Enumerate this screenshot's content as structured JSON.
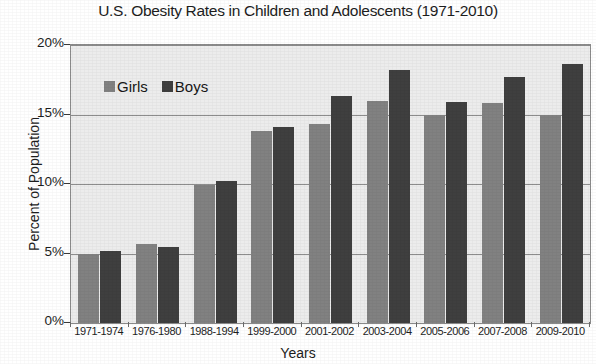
{
  "chart_data": {
    "type": "bar",
    "title": "U.S. Obesity Rates in Children and Adolescents (1971-2010)",
    "xlabel": "Years",
    "ylabel": "Percent of Population",
    "categories": [
      "1971-1974",
      "1976-1980",
      "1988-1994",
      "1999-2000",
      "2001-2002",
      "2003-2004",
      "2005-2006",
      "2007-2008",
      "2009-2010"
    ],
    "series": [
      {
        "name": "Girls",
        "color": "#818181",
        "values": [
          5.0,
          5.7,
          9.9,
          13.8,
          14.3,
          16.0,
          15.0,
          15.8,
          15.0
        ]
      },
      {
        "name": "Boys",
        "color": "#3f3f3f",
        "values": [
          5.2,
          5.5,
          10.2,
          14.1,
          16.3,
          18.2,
          15.9,
          17.7,
          18.6
        ]
      }
    ],
    "ylim": [
      0,
      20
    ],
    "ytick_values": [
      0,
      5,
      10,
      15,
      20
    ],
    "ytick_labels": [
      "0%",
      "5%",
      "10%",
      "15%",
      "20%"
    ],
    "grid": true,
    "legend_position": "upper-left-inside",
    "plot_background": "#ececec"
  }
}
